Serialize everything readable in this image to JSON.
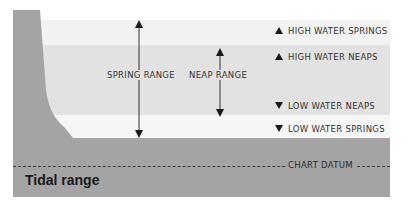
{
  "diagram": {
    "title": "Tidal range",
    "datum_label": "CHART DATUM",
    "ranges": [
      {
        "label": "SPRING RANGE",
        "from": "LOW WATER SPRINGS",
        "to": "HIGH WATER SPRINGS"
      },
      {
        "label": "NEAP RANGE",
        "from": "LOW WATER NEAPS",
        "to": "HIGH WATER NEAPS"
      }
    ],
    "levels": [
      {
        "label": "HIGH WATER SPRINGS",
        "marker": "triangle-up-icon"
      },
      {
        "label": "HIGH WATER NEAPS",
        "marker": "triangle-up-icon"
      },
      {
        "label": "LOW WATER NEAPS",
        "marker": "triangle-down-icon"
      },
      {
        "label": "LOW WATER SPRINGS",
        "marker": "triangle-down-icon"
      }
    ],
    "colors": {
      "high_springs_band": "#f2f2f2",
      "range_band": "#e2e2e2",
      "low_springs_band": "#f6f6f6",
      "seabed": "#a4a4a4",
      "cliff": "#a4a4a4",
      "ink": "#333333"
    }
  }
}
